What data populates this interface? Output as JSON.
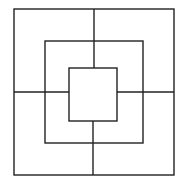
{
  "board": {
    "game": "Nine Men's Morris",
    "line_color": "#222222",
    "background": "#ffffff",
    "squares": [
      {
        "name": "outer",
        "x1": 14,
        "y1": 9,
        "x2": 174,
        "y2": 175
      },
      {
        "name": "middle",
        "x1": 45,
        "y1": 41,
        "x2": 143,
        "y2": 143
      },
      {
        "name": "inner",
        "x1": 69,
        "y1": 68,
        "x2": 117,
        "y2": 121
      }
    ],
    "connectors": [
      {
        "name": "top",
        "x1": 94,
        "y1": 9,
        "x2": 94,
        "y2": 68
      },
      {
        "name": "bottom",
        "x1": 93,
        "y1": 121,
        "x2": 93,
        "y2": 175
      },
      {
        "name": "left",
        "x1": 14,
        "y1": 92,
        "x2": 69,
        "y2": 92
      },
      {
        "name": "right",
        "x1": 117,
        "y1": 92,
        "x2": 174,
        "y2": 92
      }
    ]
  }
}
